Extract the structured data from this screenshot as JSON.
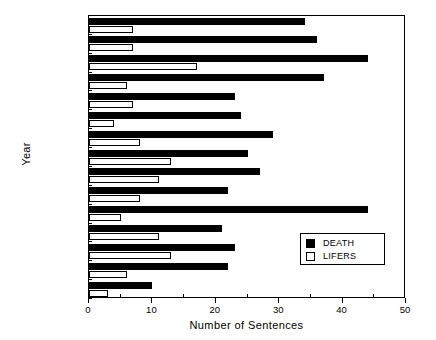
{
  "chart_data": {
    "type": "bar",
    "orientation": "horizontal",
    "title": "",
    "xlabel": "Number of Sentences",
    "ylabel": "Year",
    "xlim": [
      0,
      50
    ],
    "xticks": [
      0,
      10,
      20,
      30,
      40,
      50
    ],
    "xminorticks": [
      5,
      15,
      25,
      35,
      45
    ],
    "grid": false,
    "legend_position": "lower right",
    "categories": [
      "1988",
      "1987",
      "1986",
      "1985",
      "1984",
      "1983",
      "1982",
      "1981",
      "1980",
      "1979",
      "1978",
      "1977",
      "1976",
      "1975",
      "1974"
    ],
    "series": [
      {
        "name": "DEATH",
        "color": "#000000",
        "style": "filled",
        "values": [
          34,
          36,
          44,
          37,
          23,
          24,
          29,
          25,
          27,
          22,
          44,
          21,
          23,
          22,
          10
        ]
      },
      {
        "name": "LIFERS",
        "color": "#ffffff",
        "style": "hollow",
        "values": [
          7,
          7,
          17,
          6,
          7,
          4,
          8,
          13,
          11,
          8,
          5,
          11,
          13,
          6,
          3
        ]
      }
    ]
  },
  "legend": {
    "entries": [
      {
        "label": "DEATH",
        "swatch": "filled-square-icon"
      },
      {
        "label": "LIFERS",
        "swatch": "hollow-square-icon"
      }
    ]
  }
}
